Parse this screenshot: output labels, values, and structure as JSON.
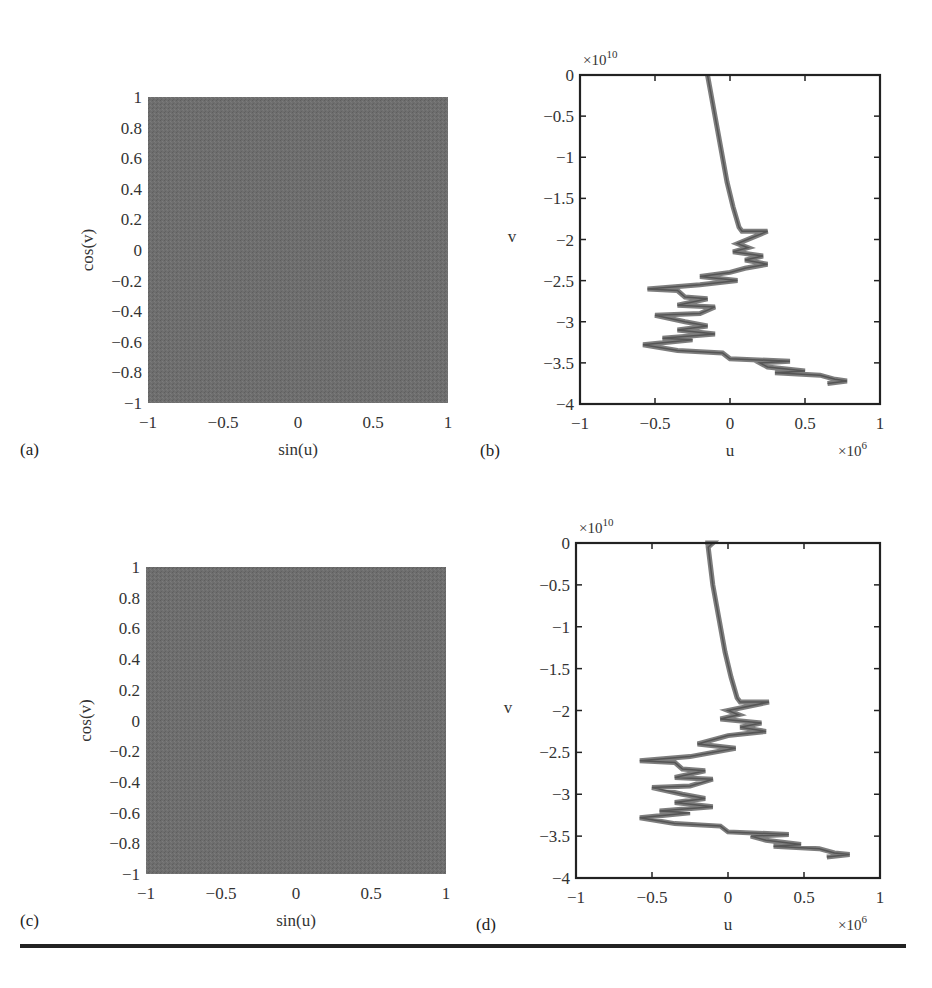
{
  "chart_data": [
    {
      "panel": "(a)",
      "type": "scatter",
      "title": "",
      "xlabel": "sin(u)",
      "ylabel": "cos(v)",
      "xlim": [
        -1,
        1
      ],
      "ylim": [
        -1,
        1
      ],
      "xticks": [
        "−1",
        "−0.5",
        "0",
        "0.5",
        "1"
      ],
      "yticks": [
        "1",
        "0.8",
        "0.6",
        "0.4",
        "0.2",
        "0",
        "−0.2",
        "−0.4",
        "−0.6",
        "−0.8",
        "−1"
      ],
      "description": "Dense point cloud uniformly filling the square [-1,1]x[-1,1]",
      "fill_color": "#6e6e6e"
    },
    {
      "panel": "(b)",
      "type": "line",
      "title": "",
      "xlabel": "u",
      "ylabel": "v",
      "x_exponent": "×10^6",
      "y_exponent": "×10^10",
      "xlim": [
        -1,
        1
      ],
      "ylim": [
        -4,
        0
      ],
      "xticks": [
        "−1",
        "−0.5",
        "0",
        "0.5",
        "1"
      ],
      "yticks": [
        "0",
        "−0.5",
        "−1",
        "−1.5",
        "−2",
        "−2.5",
        "−3",
        "−3.5",
        "−4"
      ],
      "series": [
        {
          "name": "trajectory",
          "x": [
            -0.15,
            -0.13,
            -0.1,
            -0.06,
            -0.02,
            0.02,
            0.06,
            0.08,
            0.25,
            0.05,
            0.12,
            0.02,
            0.22,
            0.1,
            0.25,
            0.1,
            0.0,
            -0.2,
            0.05,
            -0.2,
            -0.55,
            -0.35,
            -0.3,
            -0.15,
            -0.35,
            -0.1,
            -0.2,
            -0.5,
            -0.3,
            -0.15,
            -0.35,
            -0.1,
            -0.45,
            -0.25,
            -0.58,
            -0.35,
            -0.05,
            0.0,
            0.4,
            0.2,
            0.25,
            0.5,
            0.3,
            0.6,
            0.7,
            0.78,
            0.65
          ],
          "y": [
            0.0,
            -0.2,
            -0.5,
            -0.9,
            -1.3,
            -1.6,
            -1.85,
            -1.9,
            -1.9,
            -2.05,
            -2.1,
            -2.15,
            -2.2,
            -2.25,
            -2.3,
            -2.35,
            -2.4,
            -2.45,
            -2.5,
            -2.55,
            -2.6,
            -2.62,
            -2.7,
            -2.72,
            -2.8,
            -2.82,
            -2.9,
            -2.92,
            -3.0,
            -3.05,
            -3.1,
            -3.15,
            -3.2,
            -3.22,
            -3.28,
            -3.35,
            -3.38,
            -3.45,
            -3.48,
            -3.5,
            -3.55,
            -3.6,
            -3.62,
            -3.65,
            -3.7,
            -3.72,
            -3.75
          ]
        }
      ],
      "line_color": "#707070"
    },
    {
      "panel": "(c)",
      "type": "scatter",
      "title": "",
      "xlabel": "sin(u)",
      "ylabel": "cos(v)",
      "xlim": [
        -1,
        1
      ],
      "ylim": [
        -1,
        1
      ],
      "xticks": [
        "−1",
        "−0.5",
        "0",
        "0.5",
        "1"
      ],
      "yticks": [
        "1",
        "0.8",
        "0.6",
        "0.4",
        "0.2",
        "0",
        "−0.2",
        "−0.4",
        "−0.6",
        "−0.8",
        "−1"
      ],
      "description": "Dense point cloud uniformly filling the square [-1,1]x[-1,1]",
      "fill_color": "#6e6e6e"
    },
    {
      "panel": "(d)",
      "type": "line",
      "title": "",
      "xlabel": "u",
      "ylabel": "v",
      "x_exponent": "×10^6",
      "y_exponent": "×10^10",
      "xlim": [
        -1,
        1
      ],
      "ylim": [
        -4,
        0
      ],
      "xticks": [
        "−1",
        "−0.5",
        "0",
        "0.5",
        "1"
      ],
      "yticks": [
        "0",
        "−0.5",
        "−1",
        "−1.5",
        "−2",
        "−2.5",
        "−3",
        "−3.5",
        "−4"
      ],
      "series": [
        {
          "name": "trajectory",
          "x": [
            -0.15,
            -0.1,
            -0.13,
            -0.1,
            -0.06,
            -0.02,
            0.02,
            0.06,
            0.08,
            0.27,
            0.0,
            0.07,
            -0.05,
            0.22,
            0.08,
            0.25,
            0.0,
            -0.2,
            0.05,
            -0.25,
            -0.58,
            -0.35,
            -0.3,
            -0.15,
            -0.35,
            -0.1,
            -0.25,
            -0.5,
            -0.3,
            -0.15,
            -0.35,
            -0.1,
            -0.45,
            -0.25,
            -0.58,
            -0.35,
            -0.05,
            0.0,
            0.4,
            0.15,
            0.25,
            0.48,
            0.3,
            0.6,
            0.7,
            0.8,
            0.65
          ],
          "y": [
            0.0,
            0.0,
            -0.05,
            -0.5,
            -0.9,
            -1.3,
            -1.6,
            -1.85,
            -1.9,
            -1.9,
            -2.0,
            -2.05,
            -2.1,
            -2.15,
            -2.2,
            -2.25,
            -2.3,
            -2.4,
            -2.45,
            -2.55,
            -2.6,
            -2.62,
            -2.7,
            -2.72,
            -2.8,
            -2.82,
            -2.9,
            -2.92,
            -3.0,
            -3.05,
            -3.1,
            -3.15,
            -3.2,
            -3.22,
            -3.28,
            -3.35,
            -3.38,
            -3.45,
            -3.48,
            -3.5,
            -3.55,
            -3.6,
            -3.62,
            -3.65,
            -3.7,
            -3.72,
            -3.75
          ]
        }
      ],
      "line_color": "#707070"
    }
  ],
  "layout": {
    "panels": [
      {
        "left": 148,
        "top": 97,
        "right": 448,
        "bottom": 403
      },
      {
        "left": 580,
        "top": 75,
        "right": 880,
        "bottom": 404
      },
      {
        "left": 146,
        "top": 567,
        "right": 446,
        "bottom": 874
      },
      {
        "left": 576,
        "top": 543,
        "right": 880,
        "bottom": 878
      }
    ],
    "separator": {
      "x1": 20,
      "x2": 906,
      "y": 946,
      "color": "#222222"
    }
  }
}
